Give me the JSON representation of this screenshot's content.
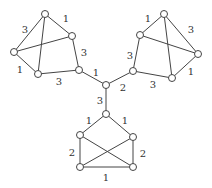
{
  "nodes": [
    {
      "id": "L1",
      "x": 45,
      "y": 14
    },
    {
      "id": "L2",
      "x": 72,
      "y": 36
    },
    {
      "id": "L3",
      "x": 14,
      "y": 52
    },
    {
      "id": "L4",
      "x": 38,
      "y": 74
    },
    {
      "id": "L5",
      "x": 79,
      "y": 70
    },
    {
      "id": "C",
      "x": 106,
      "y": 85
    },
    {
      "id": "R1",
      "x": 164,
      "y": 14
    },
    {
      "id": "R2",
      "x": 140,
      "y": 35
    },
    {
      "id": "R3",
      "x": 198,
      "y": 54
    },
    {
      "id": "R4",
      "x": 133,
      "y": 71
    },
    {
      "id": "R5",
      "x": 172,
      "y": 78
    },
    {
      "id": "B1",
      "x": 106,
      "y": 114
    },
    {
      "id": "B2",
      "x": 80,
      "y": 135
    },
    {
      "id": "B3",
      "x": 133,
      "y": 137
    },
    {
      "id": "B4",
      "x": 80,
      "y": 167
    },
    {
      "id": "B5",
      "x": 133,
      "y": 167
    }
  ],
  "edges": [
    {
      "from": "L1",
      "to": "L2",
      "label": "1",
      "lx": 66,
      "ly": 18
    },
    {
      "from": "L1",
      "to": "L3",
      "label": "3",
      "lx": 25,
      "ly": 29
    },
    {
      "from": "L1",
      "to": "L4",
      "label": ""
    },
    {
      "from": "L3",
      "to": "L2",
      "label": ""
    },
    {
      "from": "L3",
      "to": "L4",
      "label": "1",
      "lx": 20,
      "ly": 69
    },
    {
      "from": "L2",
      "to": "L5",
      "label": "3",
      "lx": 84,
      "ly": 52
    },
    {
      "from": "L4",
      "to": "L5",
      "label": "3",
      "lx": 59,
      "ly": 81
    },
    {
      "from": "L5",
      "to": "C",
      "label": "1",
      "lx": 96,
      "ly": 72
    },
    {
      "from": "R1",
      "to": "R2",
      "label": "1",
      "lx": 148,
      "ly": 18
    },
    {
      "from": "R1",
      "to": "R3",
      "label": "3",
      "lx": 191,
      "ly": 29
    },
    {
      "from": "R1",
      "to": "R5",
      "label": ""
    },
    {
      "from": "R2",
      "to": "R3",
      "label": ""
    },
    {
      "from": "R2",
      "to": "R4",
      "label": "3",
      "lx": 130,
      "ly": 55
    },
    {
      "from": "R3",
      "to": "R5",
      "label": "1",
      "lx": 191,
      "ly": 71
    },
    {
      "from": "R4",
      "to": "R5",
      "label": "3",
      "lx": 153,
      "ly": 84
    },
    {
      "from": "C",
      "to": "R4",
      "label": "2",
      "lx": 123,
      "ly": 87
    },
    {
      "from": "C",
      "to": "B1",
      "label": "3",
      "lx": 100,
      "ly": 100
    },
    {
      "from": "B1",
      "to": "B2",
      "label": "1",
      "lx": 89,
      "ly": 120
    },
    {
      "from": "B1",
      "to": "B3",
      "label": "1",
      "lx": 125,
      "ly": 120
    },
    {
      "from": "B2",
      "to": "B4",
      "label": "2",
      "lx": 72,
      "ly": 152
    },
    {
      "from": "B3",
      "to": "B5",
      "label": "2",
      "lx": 143,
      "ly": 153
    },
    {
      "from": "B2",
      "to": "B5",
      "label": ""
    },
    {
      "from": "B3",
      "to": "B4",
      "label": ""
    },
    {
      "from": "B4",
      "to": "B5",
      "label": "1",
      "lx": 106,
      "ly": 177
    }
  ]
}
